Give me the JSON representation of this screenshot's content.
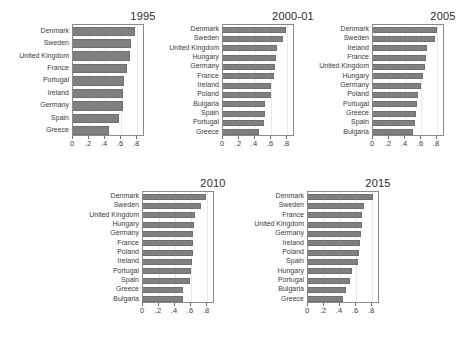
{
  "chart_data": {
    "type": "bar",
    "orientation": "horizontal",
    "title": "",
    "xlabel": "",
    "ylabel": "",
    "xlim": [
      0,
      0.9
    ],
    "grid": true,
    "legend": null,
    "xticks": [
      "0",
      ".2",
      ".4",
      ".6",
      ".8"
    ],
    "xtick_values": [
      0,
      0.2,
      0.4,
      0.6,
      0.8
    ],
    "panels": [
      {
        "title": "1995",
        "categories": [
          "Denmark",
          "Sweden",
          "United Kingdom",
          "France",
          "Portugal",
          "Ireland",
          "Germany",
          "Spain",
          "Greece"
        ],
        "values": [
          0.78,
          0.73,
          0.71,
          0.67,
          0.64,
          0.63,
          0.62,
          0.57,
          0.45
        ]
      },
      {
        "title": "2000-01",
        "categories": [
          "Denmark",
          "Sweden",
          "United Kingdom",
          "Hungary",
          "Germany",
          "France",
          "Ireland",
          "Poland",
          "Bulgaria",
          "Spain",
          "Portugal",
          "Greece"
        ],
        "values": [
          0.79,
          0.75,
          0.67,
          0.66,
          0.65,
          0.64,
          0.6,
          0.6,
          0.53,
          0.52,
          0.51,
          0.45
        ]
      },
      {
        "title": "2005",
        "categories": [
          "Denmark",
          "Sweden",
          "Ireland",
          "France",
          "United Kingdom",
          "Hungary",
          "Germany",
          "Poland",
          "Portugal",
          "Greece",
          "Spain",
          "Bulgaria"
        ],
        "values": [
          0.8,
          0.78,
          0.67,
          0.66,
          0.65,
          0.63,
          0.6,
          0.56,
          0.55,
          0.54,
          0.53,
          0.5
        ]
      },
      {
        "title": "2010",
        "categories": [
          "Denmark",
          "Sweden",
          "United Kingdom",
          "Hungary",
          "Germany",
          "France",
          "Poland",
          "Ireland",
          "Portugal",
          "Spain",
          "Greece",
          "Bulgaria"
        ],
        "values": [
          0.79,
          0.73,
          0.65,
          0.64,
          0.63,
          0.63,
          0.62,
          0.61,
          0.6,
          0.59,
          0.5,
          0.5
        ]
      },
      {
        "title": "2015",
        "categories": [
          "Denmark",
          "Sweden",
          "France",
          "United Kingdom",
          "Germany",
          "Ireland",
          "Poland",
          "Spain",
          "Hungary",
          "Portugal",
          "Bulgaria",
          "Greece"
        ],
        "values": [
          0.81,
          0.7,
          0.68,
          0.67,
          0.66,
          0.65,
          0.64,
          0.63,
          0.55,
          0.52,
          0.48,
          0.44
        ]
      }
    ]
  },
  "colors": {
    "bar": "#808080",
    "bar_edge": "#6f6f6f",
    "axis": "#8a8a8a",
    "grid": "#e9e9e9",
    "text": "#3a3a3a",
    "background": "#ffffff"
  }
}
